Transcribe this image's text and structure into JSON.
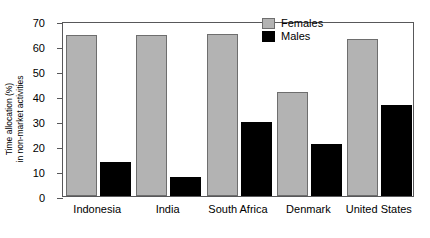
{
  "chart_data": {
    "type": "bar",
    "title": "",
    "xlabel": "",
    "ylabel": "Time allocation (%) in non-market activities",
    "ylabel_line1": "Time allocation (%)",
    "ylabel_line2": "in non-market activities",
    "ylim": [
      0,
      70
    ],
    "yticks": [
      0,
      10,
      20,
      30,
      40,
      50,
      60,
      70
    ],
    "ytick_labels": [
      "0",
      "10",
      "20",
      "30",
      "40",
      "50",
      "60",
      "70"
    ],
    "grid": false,
    "legend_position": "top-right",
    "categories": [
      "Indonesia",
      "India",
      "South Africa",
      "Denmark",
      "United States"
    ],
    "series": [
      {
        "name": "Females",
        "color": "#b3b3b3",
        "values": [
          64.5,
          64.5,
          65.0,
          41.5,
          63.0
        ]
      },
      {
        "name": "Males",
        "color": "#000000",
        "values": [
          13.5,
          7.8,
          29.5,
          20.8,
          36.5
        ]
      }
    ]
  },
  "legend": {
    "items": [
      {
        "label": "Females",
        "color": "#b3b3b3"
      },
      {
        "label": "Males",
        "color": "#000000"
      }
    ]
  },
  "axes": {
    "y_title_line1": "Time allocation (%)",
    "y_title_line2": "in non-market activities"
  },
  "colors": {
    "female_fill": "#b3b3b3",
    "female_edge": "#6e6e6e",
    "male_fill": "#000000",
    "axis": "#58585a",
    "background": "#ffffff",
    "text": "#000000"
  }
}
